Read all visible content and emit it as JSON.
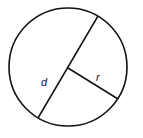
{
  "diagram": {
    "labels": {
      "diameter": "d",
      "radius": "r"
    },
    "colors": {
      "stroke": "#111111",
      "background": "#ffffff"
    }
  }
}
